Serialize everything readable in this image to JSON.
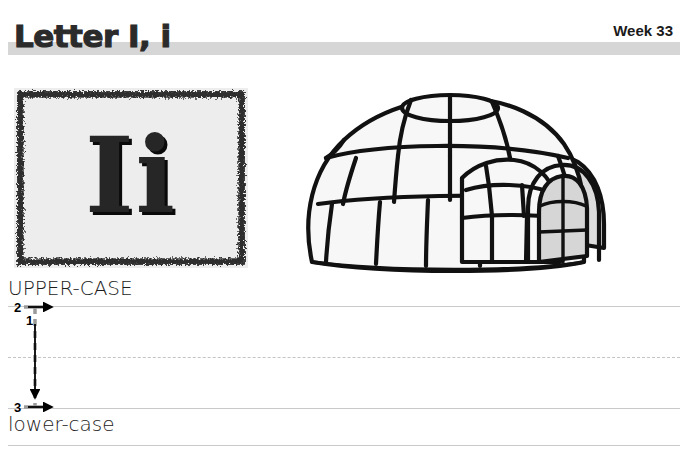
{
  "header": {
    "title": "Letter I, i",
    "week_label": "Week 33",
    "bar_color": "#d6d6d6"
  },
  "letter_card": {
    "letters": "Ii",
    "background_color": "#ededed",
    "border_style": "rough-sketch-charcoal",
    "border_color": "#2e2e2e",
    "letter_color": "#262626"
  },
  "illustration": {
    "name": "igloo",
    "alt": "igloo",
    "line_color": "#111111",
    "block_fill": "#f7f7f7",
    "shadow_fill": "#dcdcdc"
  },
  "practice": {
    "upper_case_label": "UPPER-CASE",
    "lower_case_label": "lower-case",
    "line_color": "#c9c9c9",
    "midline_style": "dashed",
    "stroke_guide": {
      "guide_color": "#9a9a9a",
      "arrow_color": "#000000",
      "strokes": [
        {
          "number": "1",
          "direction": "down",
          "description": "vertical stem from top line to baseline"
        },
        {
          "number": "2",
          "direction": "right",
          "description": "top horizontal serif"
        },
        {
          "number": "3",
          "direction": "right",
          "description": "bottom horizontal serif"
        }
      ]
    }
  }
}
